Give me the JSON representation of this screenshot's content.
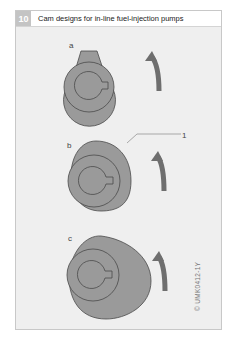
{
  "figure": {
    "number": "10",
    "title": "Cam designs for in-line fuel-injection pumps",
    "code": "© UMK0412-1Y",
    "colors": {
      "frame_bg": "#efefef",
      "cam_fill": "#9a9a9a",
      "cam_stroke": "#4a4a4a",
      "arrow": "#6e6e6e",
      "number_box": "#c4c4c4"
    }
  },
  "panels": [
    {
      "label": "a",
      "description": "Symmetrical cam with tangential flanks, clockwise rotation arrow"
    },
    {
      "label": "b",
      "description": "Asymmetrical cam with callout 1, rotation arrow"
    },
    {
      "label": "c",
      "description": "Asymmetrical wide cam, rotation arrow"
    }
  ],
  "callouts": [
    {
      "id": "1",
      "text": "1"
    }
  ]
}
